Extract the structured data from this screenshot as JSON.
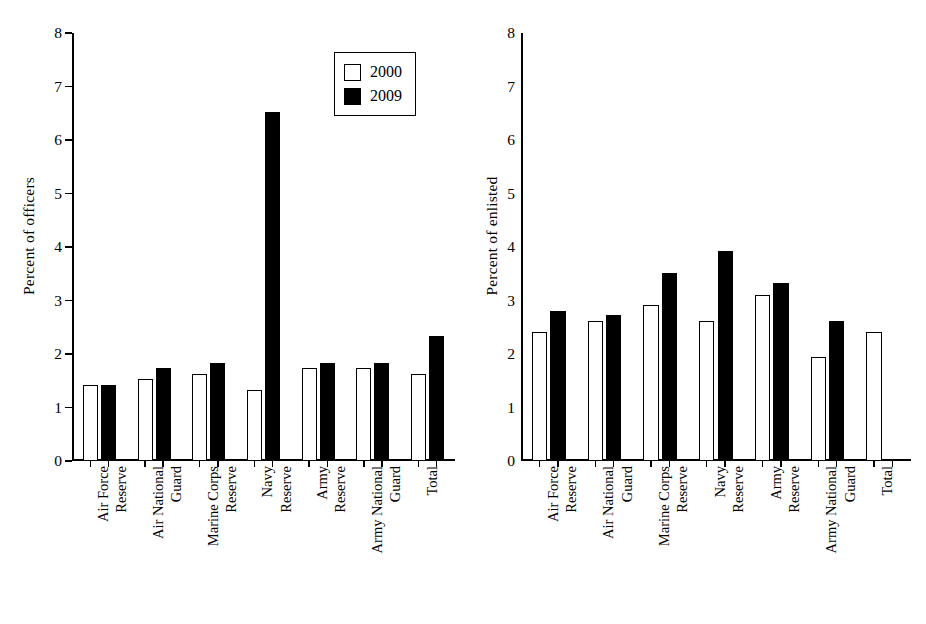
{
  "legend": {
    "position": "top-right-of-left-panel",
    "entries": [
      {
        "label": "2000",
        "style": "open",
        "color": "#ffffff"
      },
      {
        "label": "2009",
        "style": "filled",
        "color": "#000000"
      }
    ]
  },
  "colors": {
    "series_2000": "#ffffff",
    "series_2009": "#000000",
    "axis": "#000000",
    "background": "#ffffff"
  },
  "chart_data": [
    {
      "type": "bar",
      "panel": "left",
      "title": "",
      "xlabel": "",
      "ylabel": "Percent of officers",
      "ylim": [
        0,
        8
      ],
      "yticks": [
        0,
        1,
        2,
        3,
        4,
        5,
        6,
        7,
        8
      ],
      "grid": false,
      "legend": [
        "2000",
        "2009"
      ],
      "categories": [
        "Air Force",
        "Reserve",
        "Air National",
        "Guard",
        "Marine Corps",
        "Reserve",
        "Navy",
        "Reserve",
        "Army",
        "Reserve",
        "Army National",
        "Guard",
        "Total"
      ],
      "groups": [
        {
          "label_lines": [
            "Air Force",
            "Reserve"
          ],
          "v2000": 1.42,
          "v2009": 1.42
        },
        {
          "label_lines": [
            "Air National",
            "Guard"
          ],
          "v2000": 1.53,
          "v2009": 1.73
        },
        {
          "label_lines": [
            "Marine Corps",
            "Reserve"
          ],
          "v2000": 1.63,
          "v2009": 1.83
        },
        {
          "label_lines": [
            "Navy",
            "Reserve"
          ],
          "v2000": 1.33,
          "v2009": 6.52
        },
        {
          "label_lines": [
            "Army",
            "Reserve"
          ],
          "v2000": 1.73,
          "v2009": 1.83
        },
        {
          "label_lines": [
            "Army National",
            "Guard"
          ],
          "v2000": 1.73,
          "v2009": 1.83
        },
        {
          "label_lines": [
            "Total"
          ],
          "v2000": 1.63,
          "v2009": 2.33
        }
      ],
      "series": [
        {
          "name": "2000",
          "values": [
            1.42,
            1.53,
            1.63,
            1.33,
            1.73,
            1.73,
            1.63
          ]
        },
        {
          "name": "2009",
          "values": [
            1.42,
            1.73,
            1.83,
            6.52,
            1.83,
            1.83,
            2.33
          ]
        }
      ]
    },
    {
      "type": "bar",
      "panel": "right",
      "title": "",
      "xlabel": "",
      "ylabel": "Percent of enlisted",
      "ylim": [
        0,
        8
      ],
      "yticks": [
        0,
        1,
        2,
        3,
        4,
        5,
        6,
        7,
        8
      ],
      "grid": false,
      "legend": [
        "2000",
        "2009"
      ],
      "categories": [
        "Air Force",
        "Reserve",
        "Air National",
        "Guard",
        "Marine Corps",
        "Reserve",
        "Navy",
        "Reserve",
        "Army",
        "Reserve",
        "Army National",
        "Guard",
        "Total"
      ],
      "groups": [
        {
          "label_lines": [
            "Air Force",
            "Reserve"
          ],
          "v2000": 2.42,
          "v2009": 2.81
        },
        {
          "label_lines": [
            "Air National",
            "Guard"
          ],
          "v2000": 2.62,
          "v2009": 2.72
        },
        {
          "label_lines": [
            "Marine Corps",
            "Reserve"
          ],
          "v2000": 2.91,
          "v2009": 3.51
        },
        {
          "label_lines": [
            "Navy",
            "Reserve"
          ],
          "v2000": 2.62,
          "v2009": 3.92
        },
        {
          "label_lines": [
            "Army",
            "Reserve"
          ],
          "v2000": 3.11,
          "v2009": 3.32
        },
        {
          "label_lines": [
            "Army National",
            "Guard"
          ],
          "v2000": 1.95,
          "v2009": 2.62
        },
        {
          "label_lines": [
            "Total"
          ],
          "v2000": 2.42,
          "v2009": null
        }
      ],
      "series": [
        {
          "name": "2000",
          "values": [
            2.42,
            2.62,
            2.91,
            2.62,
            3.11,
            1.95,
            2.42
          ]
        },
        {
          "name": "2009",
          "values": [
            2.81,
            2.72,
            3.51,
            3.92,
            3.32,
            2.62,
            null
          ]
        }
      ]
    }
  ]
}
